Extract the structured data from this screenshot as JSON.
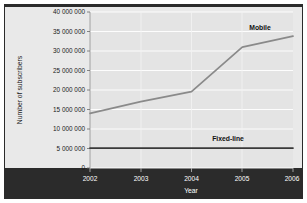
{
  "chart_data": {
    "type": "line",
    "title": "",
    "xlabel": "Year",
    "ylabel": "Number of subscribers",
    "x": [
      2002,
      2003,
      2004,
      2005,
      2006
    ],
    "categories": [
      "2002",
      "2003",
      "2004",
      "2005",
      "2006"
    ],
    "xlim": [
      2002,
      2006
    ],
    "ylim": [
      0,
      40000000
    ],
    "grid": true,
    "legend_position": "inline-labels",
    "y_ticks": [
      0,
      5000000,
      10000000,
      15000000,
      20000000,
      25000000,
      30000000,
      35000000,
      40000000
    ],
    "y_tick_labels": [
      "0",
      "5 000 000",
      "10 000 000",
      "15 000 000",
      "20 000 000",
      "25 000 000",
      "30 000 000",
      "35 000 000",
      "40 000 000"
    ],
    "series": [
      {
        "name": "Mobile",
        "values": [
          14000000,
          17000000,
          19600000,
          31000000,
          33800000
        ],
        "color": "#8a8a8a",
        "label_x": 2005.35,
        "label_y": 35400000
      },
      {
        "name": "Fixed-line",
        "values": [
          5100000,
          5100000,
          5100000,
          5100000,
          5100000
        ],
        "color": "#3a3a3a",
        "label_x": 2004.72,
        "label_y": 6900000
      }
    ]
  },
  "figure": {
    "background_color": "#ffffff",
    "plot_background_color": "#eeeeee",
    "gridline_color": "#ffffff",
    "band_color": "#2b2b2b",
    "border_color": "#2b2b2b",
    "axis_label_color": "#1a1a1a",
    "band_text_color": "#ffffff"
  },
  "labels": {
    "y_axis_title": "Number of subscribers",
    "x_axis_title": "Year",
    "series_mobile": "Mobile",
    "series_fixed_line": "Fixed-line",
    "tick_0": "0",
    "tick_5m": "5 000 000",
    "tick_10m": "10 000 000",
    "tick_15m": "15 000 000",
    "tick_20m": "20 000 000",
    "tick_25m": "25 000 000",
    "tick_30m": "30 000 000",
    "tick_35m": "35 000 000",
    "tick_40m": "40 000 000",
    "year_2002": "2002",
    "year_2003": "2003",
    "year_2004": "2004",
    "year_2005": "2005",
    "year_2006": "2006"
  }
}
